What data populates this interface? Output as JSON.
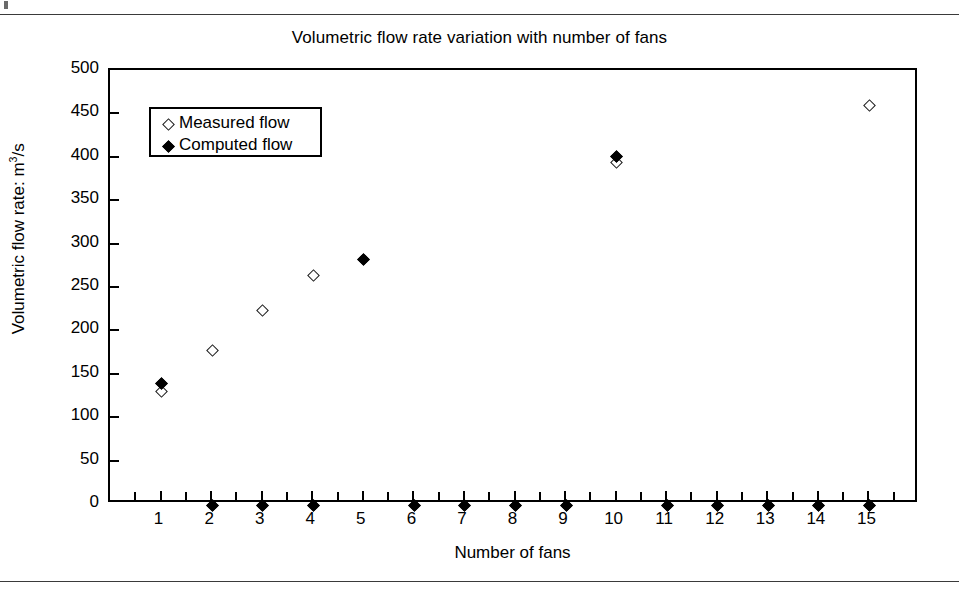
{
  "figure": {
    "title": "Volumetric flow rate variation with number of fans",
    "xlabel": "Number of fans",
    "ylabel_prefix": "Volumetric flow rate: m",
    "ylabel_sup": "3",
    "ylabel_suffix": "/s",
    "ylabel_full": "Volumetric flow rate: m3/s"
  },
  "legend": {
    "position": "top-left inside plot",
    "entries": [
      {
        "label": "Measured flow",
        "marker": "open-diamond-icon"
      },
      {
        "label": "Computed flow",
        "marker": "filled-diamond-icon"
      }
    ]
  },
  "axes": {
    "y_ticks": [
      500,
      450,
      400,
      350,
      300,
      250,
      200,
      150,
      100,
      50,
      0
    ],
    "x_ticks": [
      1,
      2,
      3,
      4,
      5,
      6,
      7,
      8,
      9,
      10,
      11,
      12,
      13,
      14,
      15
    ]
  },
  "chart_data": {
    "type": "scatter",
    "title": "Volumetric flow rate variation with number of fans",
    "xlabel": "Number of fans",
    "ylabel": "Volumetric flow rate: m3/s",
    "xlim": [
      0,
      16
    ],
    "ylim": [
      0,
      500
    ],
    "xticks": [
      1,
      2,
      3,
      4,
      5,
      6,
      7,
      8,
      9,
      10,
      11,
      12,
      13,
      14,
      15
    ],
    "yticks": [
      0,
      50,
      100,
      150,
      200,
      250,
      300,
      350,
      400,
      450,
      500
    ],
    "grid": false,
    "legend_position": "upper left",
    "series": [
      {
        "name": "Measured flow",
        "marker": "open-diamond",
        "points": [
          {
            "x": 1,
            "y": 131
          },
          {
            "x": 2,
            "y": 178
          },
          {
            "x": 3,
            "y": 224
          },
          {
            "x": 4,
            "y": 264
          },
          {
            "x": 10,
            "y": 395
          },
          {
            "x": 15,
            "y": 460
          }
        ]
      },
      {
        "name": "Computed flow",
        "marker": "filled-diamond",
        "points": [
          {
            "x": 1,
            "y": 140
          },
          {
            "x": 2,
            "y": 0
          },
          {
            "x": 3,
            "y": 0
          },
          {
            "x": 4,
            "y": 0
          },
          {
            "x": 5,
            "y": 283
          },
          {
            "x": 6,
            "y": 0
          },
          {
            "x": 7,
            "y": 0
          },
          {
            "x": 8,
            "y": 0
          },
          {
            "x": 9,
            "y": 0
          },
          {
            "x": 10,
            "y": 402
          },
          {
            "x": 11,
            "y": 0
          },
          {
            "x": 12,
            "y": 0
          },
          {
            "x": 13,
            "y": 0
          },
          {
            "x": 14,
            "y": 0
          },
          {
            "x": 15,
            "y": 0
          }
        ]
      }
    ]
  }
}
